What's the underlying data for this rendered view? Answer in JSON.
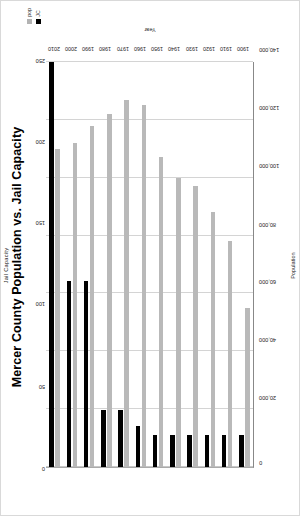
{
  "chart_data": {
    "type": "bar",
    "title": "Mercer County Population vs. Jail Capacity",
    "orientation": "horizontal-bars-rotated",
    "categories": [
      "1900",
      "1910",
      "1920",
      "1930",
      "1940",
      "1950",
      "1960",
      "1970",
      "1980",
      "1990",
      "2000",
      "2010"
    ],
    "xlabel": "Year",
    "ylabel": "Population",
    "y2label": "Jail Capacity",
    "ylim": [
      0,
      140000
    ],
    "y2lim": [
      0,
      250
    ],
    "yticks": [
      "0",
      "20,000",
      "40,000",
      "60,000",
      "80,000",
      "100,000",
      "120,000",
      "140,000"
    ],
    "y2ticks": [
      "0",
      "50",
      "100",
      "150",
      "200",
      "250"
    ],
    "grid": true,
    "legend_position": "top-right",
    "series": [
      {
        "name": "pop",
        "axis": "left",
        "color": "#b9b9b9",
        "values": [
          55000,
          78000,
          88000,
          97000,
          100000,
          107000,
          125000,
          127000,
          122000,
          118000,
          112000,
          110000
        ]
      },
      {
        "name": "JC",
        "axis": "right",
        "color": "#000000",
        "values": [
          20,
          20,
          20,
          20,
          20,
          20,
          25,
          35,
          35,
          115,
          115,
          250
        ]
      }
    ]
  },
  "legend": {
    "items": [
      {
        "label": "pop",
        "swatch": "gray-swatch-icon"
      },
      {
        "label": "JC",
        "swatch": "black-swatch-icon"
      }
    ]
  }
}
